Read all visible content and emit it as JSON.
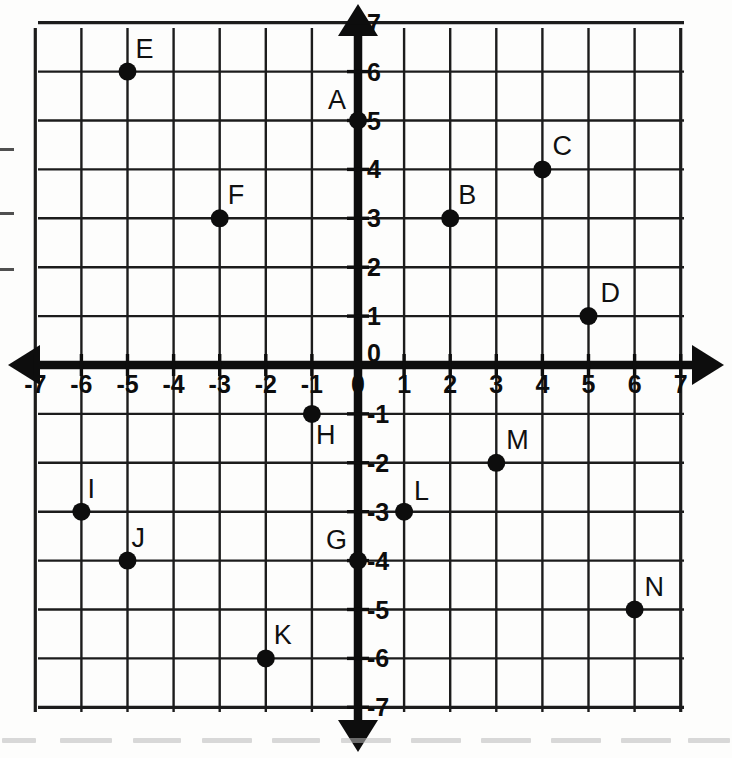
{
  "document": {
    "title": "Coordinate Plane with Plotted Points",
    "background_color": "#fdfdfc",
    "ink_color": "#101010"
  },
  "chart_data": {
    "type": "scatter",
    "title": "",
    "xlabel": "",
    "ylabel": "",
    "xlim": [
      -7,
      7
    ],
    "ylim": [
      -7,
      7
    ],
    "grid": true,
    "grid_step": 1,
    "legend": "none",
    "axis_style": "double-arrow",
    "x_ticks": [
      -7,
      -6,
      -5,
      -4,
      -3,
      -2,
      -1,
      0,
      1,
      2,
      3,
      4,
      5,
      6,
      7
    ],
    "y_ticks": [
      -7,
      -6,
      -5,
      -4,
      -3,
      -2,
      -1,
      0,
      1,
      2,
      3,
      4,
      5,
      6,
      7
    ],
    "x_tick_labels": [
      "-7",
      "-6",
      "-5",
      "-4",
      "-3",
      "-2",
      "-1",
      "0",
      "1",
      "2",
      "3",
      "4",
      "5",
      "6",
      "7"
    ],
    "y_tick_labels": [
      "-7",
      "-6",
      "-5",
      "-4",
      "-3",
      "-2",
      "-1",
      "0",
      "1",
      "2",
      "3",
      "4",
      "5",
      "6",
      "7"
    ],
    "points": [
      {
        "label": "A",
        "x": 0,
        "y": 5,
        "label_dx": -30,
        "label_dy": -34
      },
      {
        "label": "B",
        "x": 2,
        "y": 3,
        "label_dx": 8,
        "label_dy": -36
      },
      {
        "label": "C",
        "x": 4,
        "y": 4,
        "label_dx": 10,
        "label_dy": -36
      },
      {
        "label": "D",
        "x": 5,
        "y": 1,
        "label_dx": 12,
        "label_dy": -36
      },
      {
        "label": "E",
        "x": -5,
        "y": 6,
        "label_dx": 8,
        "label_dy": -36
      },
      {
        "label": "F",
        "x": -3,
        "y": 3,
        "label_dx": 8,
        "label_dy": -36
      },
      {
        "label": "G",
        "x": 0,
        "y": -4,
        "label_dx": -32,
        "label_dy": -34
      },
      {
        "label": "H",
        "x": -1,
        "y": -1,
        "label_dx": 4,
        "label_dy": 8
      },
      {
        "label": "I",
        "x": -6,
        "y": -3,
        "label_dx": 6,
        "label_dy": -36
      },
      {
        "label": "J",
        "x": -5,
        "y": -4,
        "label_dx": 4,
        "label_dy": -36
      },
      {
        "label": "K",
        "x": -2,
        "y": -6,
        "label_dx": 8,
        "label_dy": -36
      },
      {
        "label": "L",
        "x": 1,
        "y": -3,
        "label_dx": 10,
        "label_dy": -34
      },
      {
        "label": "M",
        "x": 3,
        "y": -2,
        "label_dx": 10,
        "label_dy": -36
      },
      {
        "label": "N",
        "x": 6,
        "y": -5,
        "label_dx": 10,
        "label_dy": -36
      }
    ]
  },
  "geometry": {
    "origin_x": 358,
    "origin_y": 365,
    "unit_x": 46.1,
    "unit_y": 48.9,
    "grid_left": 38,
    "grid_right": 684,
    "grid_top": 28,
    "grid_bottom": 712,
    "point_radius": 9
  },
  "artifacts": {
    "edge_dashes": [
      {
        "x": 0,
        "y": 148
      },
      {
        "x": 0,
        "y": 212
      },
      {
        "x": 0,
        "y": 268
      }
    ],
    "foot_smudges": [
      {
        "x": 2,
        "w": 34
      },
      {
        "x": 60,
        "w": 52
      },
      {
        "x": 133,
        "w": 48
      },
      {
        "x": 202,
        "w": 50
      },
      {
        "x": 272,
        "w": 48
      },
      {
        "x": 341,
        "w": 50
      },
      {
        "x": 411,
        "w": 50
      },
      {
        "x": 481,
        "w": 50
      },
      {
        "x": 551,
        "w": 50
      },
      {
        "x": 621,
        "w": 50
      },
      {
        "x": 688,
        "w": 42
      }
    ]
  }
}
